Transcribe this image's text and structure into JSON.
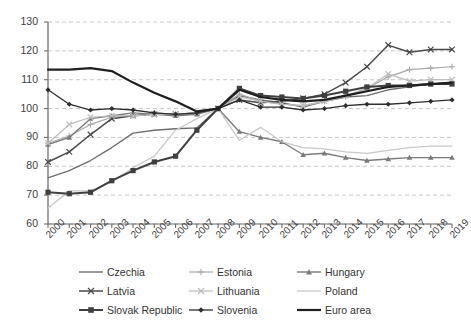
{
  "chart_data": {
    "type": "line",
    "title": "",
    "xlabel": "",
    "ylabel": "",
    "ylim": [
      60,
      130
    ],
    "ytick_step": 10,
    "grid": true,
    "legend_position": "bottom",
    "x": [
      "2000",
      "2001",
      "2002",
      "2003",
      "2004",
      "2005",
      "2006",
      "2007",
      "2008",
      "2009",
      "2010",
      "2011",
      "2012",
      "2013",
      "2014",
      "2015",
      "2016",
      "2017",
      "2018",
      "2019"
    ],
    "yticks": [
      "60",
      "70",
      "80",
      "90",
      "100",
      "110",
      "120",
      "130"
    ],
    "series": [
      {
        "name": "Czechia",
        "color": "#6e6e6e",
        "marker": "none",
        "width": 1.4,
        "values": [
          76.0,
          78.5,
          82.0,
          86.5,
          91.5,
          92.5,
          93.0,
          93.3,
          100.0,
          104.5,
          103.0,
          102.0,
          100.5,
          102.5,
          104.0,
          104.5,
          106.5,
          107.5,
          108.5,
          109.0
        ]
      },
      {
        "name": "Estonia",
        "color": "#a8a8a8",
        "marker": "plus",
        "width": 1.2,
        "values": [
          88.0,
          90.5,
          94.5,
          97.0,
          97.5,
          98.5,
          98.0,
          98.3,
          100.0,
          105.0,
          102.5,
          101.5,
          101.0,
          102.5,
          104.0,
          107.0,
          111.0,
          113.5,
          114.0,
          114.5
        ]
      },
      {
        "name": "Hungary",
        "color": "#7a7a7a",
        "marker": "triangle",
        "width": 1.4,
        "values": [
          87.5,
          90.0,
          96.5,
          97.5,
          98.5,
          98.0,
          97.5,
          98.0,
          100.0,
          92.0,
          90.0,
          88.5,
          84.0,
          84.5,
          83.0,
          82.0,
          82.5,
          83.0,
          83.0,
          83.0
        ]
      },
      {
        "name": "Latvia",
        "color": "#4a4a4a",
        "marker": "x",
        "width": 1.5,
        "values": [
          81.5,
          85.0,
          91.0,
          96.5,
          97.5,
          98.0,
          98.0,
          98.5,
          100.0,
          103.0,
          102.0,
          102.5,
          103.5,
          105.0,
          109.0,
          114.5,
          122.0,
          119.5,
          120.5,
          120.5
        ]
      },
      {
        "name": "Lithuania",
        "color": "#bdbdbd",
        "marker": "x",
        "width": 1.2,
        "values": [
          88.0,
          94.5,
          97.0,
          97.5,
          97.5,
          98.0,
          98.0,
          98.5,
          100.0,
          104.0,
          102.5,
          101.5,
          101.0,
          102.5,
          104.5,
          107.0,
          112.0,
          109.5,
          110.0,
          110.0
        ]
      },
      {
        "name": "Poland",
        "color": "#c8c8c8",
        "marker": "none",
        "width": 1.3,
        "values": [
          65.5,
          71.5,
          71.5,
          74.5,
          79.5,
          83.5,
          92.5,
          96.5,
          100.0,
          89.0,
          93.5,
          88.5,
          86.5,
          86.0,
          85.0,
          84.5,
          85.5,
          86.5,
          87.0,
          87.0
        ]
      },
      {
        "name": "Slovak Republic",
        "color": "#3f3f3f",
        "marker": "square",
        "width": 2.0,
        "values": [
          71.0,
          70.5,
          71.0,
          75.0,
          78.5,
          81.5,
          83.5,
          92.5,
          100.0,
          107.0,
          104.5,
          104.0,
          103.5,
          104.5,
          106.0,
          107.5,
          108.0,
          108.0,
          108.5,
          108.5
        ]
      },
      {
        "name": "Slovenia",
        "color": "#2e2e2e",
        "marker": "diamond",
        "width": 1.3,
        "values": [
          106.5,
          101.5,
          99.5,
          100.0,
          99.5,
          98.5,
          98.0,
          98.5,
          100.0,
          103.0,
          100.5,
          100.5,
          99.5,
          100.0,
          101.0,
          101.5,
          101.5,
          102.0,
          102.5,
          103.0
        ]
      },
      {
        "name": "Euro area",
        "color": "#1f1f1f",
        "marker": "none",
        "width": 2.2,
        "values": [
          113.5,
          113.5,
          114.0,
          113.0,
          109.0,
          105.5,
          102.5,
          99.0,
          100.0,
          106.5,
          104.0,
          103.0,
          102.5,
          103.0,
          104.5,
          106.0,
          107.5,
          108.0,
          108.5,
          109.0
        ]
      }
    ]
  },
  "axes": {
    "y_ticks": [
      "130",
      "120",
      "110",
      "100",
      "90",
      "80",
      "70",
      "60"
    ],
    "x_ticks": [
      "2000",
      "2001",
      "2002",
      "2003",
      "2004",
      "2005",
      "2006",
      "2007",
      "2008",
      "2009",
      "2010",
      "2011",
      "2012",
      "2013",
      "2014",
      "2015",
      "2016",
      "2017",
      "2018",
      "2019"
    ]
  },
  "legend": {
    "items": [
      {
        "label": "Czechia",
        "marker": "none",
        "color": "#6e6e6e"
      },
      {
        "label": "Estonia",
        "marker": "plus",
        "color": "#a8a8a8"
      },
      {
        "label": "Hungary",
        "marker": "triangle",
        "color": "#7a7a7a"
      },
      {
        "label": "Latvia",
        "marker": "x",
        "color": "#4a4a4a"
      },
      {
        "label": "Lithuania",
        "marker": "x",
        "color": "#bdbdbd"
      },
      {
        "label": "Poland",
        "marker": "none",
        "color": "#c8c8c8"
      },
      {
        "label": "Slovak Republic",
        "marker": "square",
        "color": "#3f3f3f"
      },
      {
        "label": "Slovenia",
        "marker": "diamond",
        "color": "#2e2e2e"
      },
      {
        "label": "Euro area",
        "marker": "none",
        "color": "#1f1f1f"
      }
    ]
  }
}
